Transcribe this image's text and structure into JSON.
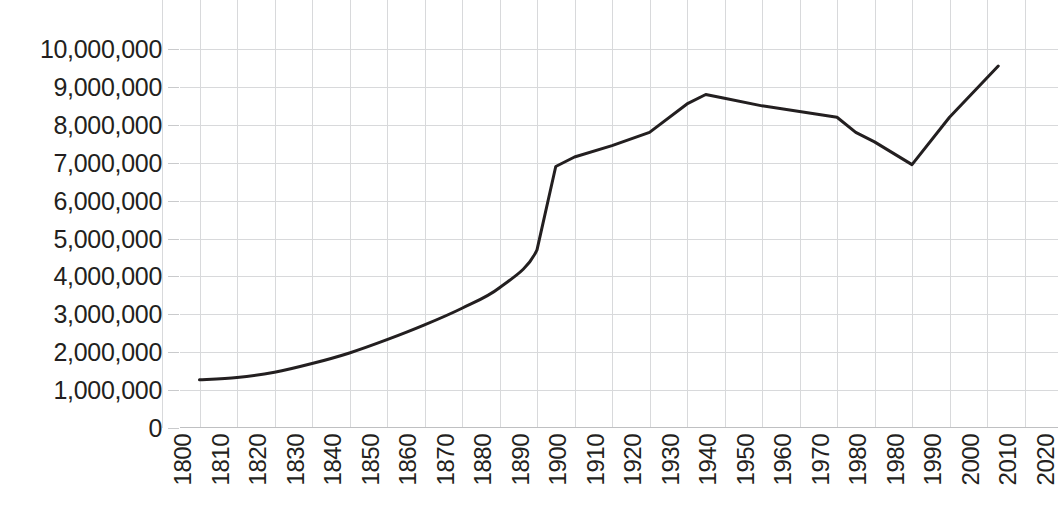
{
  "chart_data": {
    "type": "line",
    "title": "",
    "subtitle": "",
    "xlabel": "",
    "ylabel": "",
    "grid": true,
    "legend": "none",
    "xlim": [
      1800,
      2030
    ],
    "ylim": [
      0,
      10000000
    ],
    "y_ticks": [
      "0",
      "1,000,000",
      "2,000,000",
      "3,000,000",
      "4,000,000",
      "5,000,000",
      "6,000,000",
      "7,000,000",
      "8,000,000",
      "9,000,000",
      "10,000,000"
    ],
    "y_tick_values": [
      0,
      1000000,
      2000000,
      3000000,
      4000000,
      5000000,
      6000000,
      7000000,
      8000000,
      9000000,
      10000000
    ],
    "x_ticks": [
      "1800",
      "1810",
      "1820",
      "1830",
      "1840",
      "1850",
      "1860",
      "1870",
      "1880",
      "1890",
      "1900",
      "1910",
      "1920",
      "1930",
      "1940",
      "1950",
      "1960",
      "1970",
      "1980",
      "1980",
      "1990",
      "2000",
      "2010",
      "2020"
    ],
    "x_tick_values": [
      1800,
      1810,
      1820,
      1830,
      1840,
      1850,
      1860,
      1870,
      1880,
      1890,
      1900,
      1910,
      1920,
      1930,
      1940,
      1950,
      1960,
      1970,
      1980,
      1990,
      2000,
      2010,
      2020,
      2030
    ],
    "series": [
      {
        "name": "Population",
        "color": "#231f20",
        "x": [
          1810,
          1820,
          1830,
          1840,
          1850,
          1860,
          1870,
          1880,
          1890,
          1900,
          1905,
          1910,
          1920,
          1930,
          1940,
          1945,
          1950,
          1960,
          1970,
          1980,
          1985,
          1990,
          2000,
          2010,
          2023
        ],
        "values": [
          1270000,
          1330000,
          1470000,
          1700000,
          1980000,
          2330000,
          2720000,
          3160000,
          3700000,
          4700000,
          6900000,
          7150000,
          7450000,
          7800000,
          8550000,
          8800000,
          8700000,
          8500000,
          8350000,
          8200000,
          7800000,
          7550000,
          6950000,
          8200000,
          9550000
        ]
      }
    ]
  },
  "style": {
    "line_color": "#231f20",
    "gridline_color": "#d8d9db",
    "text_color": "#231f20",
    "background": "#ffffff",
    "line_width_px": 3
  }
}
